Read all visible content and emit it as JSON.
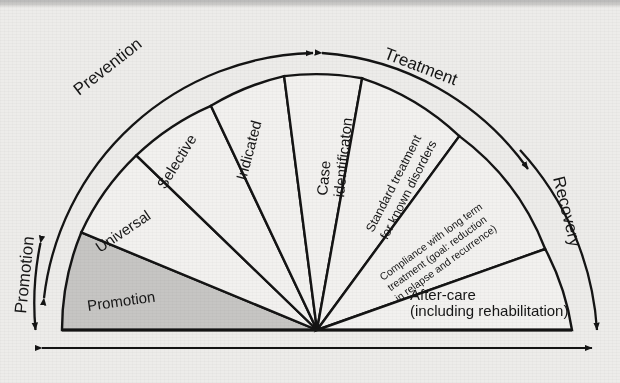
{
  "figure": {
    "type": "semicircle-wedge-diagram",
    "background_color": "#edecea",
    "line_color": "#141414",
    "shaded_wedge_color": "#c6c5c3",
    "unshaded_wedge_color": "#f2f1ef"
  },
  "arc_labels": [
    {
      "id": "promotion-arc",
      "text": "Promotion",
      "arrowheads": "both",
      "side": "left-lower"
    },
    {
      "id": "prevention-arc",
      "text": "Prevention",
      "arrowheads": "both",
      "side": "left-upper"
    },
    {
      "id": "treatment-arc",
      "text": "Treatment",
      "arrowheads": "both",
      "side": "right-upper"
    },
    {
      "id": "recovery-arc",
      "text": "Recovery",
      "arrowheads": "end",
      "side": "right-lower"
    }
  ],
  "wedges": [
    {
      "id": "promotion",
      "label": "Promotion",
      "shaded": true,
      "lines": [
        "Promotion"
      ]
    },
    {
      "id": "universal",
      "label": "Universal",
      "shaded": false,
      "lines": [
        "Universal"
      ]
    },
    {
      "id": "selective",
      "label": "Selective",
      "shaded": false,
      "lines": [
        "Selective"
      ]
    },
    {
      "id": "indicated",
      "label": "Indicated",
      "shaded": false,
      "lines": [
        "Indicated"
      ]
    },
    {
      "id": "case-identification",
      "label": "Case identificaton",
      "shaded": false,
      "lines": [
        "Case",
        "identificaton"
      ]
    },
    {
      "id": "standard-treatment",
      "label": "Standard treatment for known disorders",
      "shaded": false,
      "lines": [
        "Standard treatment",
        "for known disorders"
      ]
    },
    {
      "id": "compliance",
      "label": "Compliance with long term treatment (goal: reduction in relapse and recurrence)",
      "shaded": false,
      "lines": [
        "Compliance with long term",
        "treatment (goal: reduction",
        "in relapse and recurrence)"
      ]
    },
    {
      "id": "after-care",
      "label": "After-care (including rehabilitation)",
      "shaded": false,
      "lines": [
        "After-care",
        "(including rehabilitation)"
      ]
    }
  ],
  "baseline_arrow": {
    "id": "continuum-arrow",
    "arrowheads": "both",
    "text": ""
  },
  "wedge_text": {
    "promotion": "Promotion",
    "universal": "Universal",
    "selective": "Selective",
    "indicated": "Indicated",
    "case_1": "Case",
    "case_2": "identificaton",
    "standard_1": "Standard treatment",
    "standard_2": "for known disorders",
    "compliance_1": "Compliance with long term",
    "compliance_2": "treatment (goal: reduction",
    "compliance_3": "in relapse and recurrence)",
    "aftercare_1": "After-care",
    "aftercare_2": "(including rehabilitation)"
  },
  "arc_text": {
    "promotion": "Promotion",
    "prevention": "Prevention",
    "treatment": "Treatment",
    "recovery": "Recovery"
  }
}
